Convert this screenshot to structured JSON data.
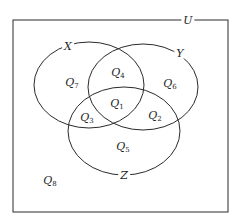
{
  "diagram": {
    "type": "venn",
    "universe": {
      "label": "U",
      "x": 13,
      "y": 20,
      "width": 215,
      "height": 192
    },
    "sets": [
      {
        "id": "X",
        "label": "X",
        "cx": 89,
        "cy": 85,
        "rx": 55,
        "ry": 43,
        "label_x": 68,
        "label_y": 46
      },
      {
        "id": "Y",
        "label": "Y",
        "cx": 143,
        "cy": 87,
        "rx": 55,
        "ry": 43,
        "label_x": 180,
        "label_y": 53
      },
      {
        "id": "Z",
        "label": "Z",
        "cx": 124,
        "cy": 131,
        "rx": 56,
        "ry": 44,
        "label_x": 124,
        "label_y": 175
      }
    ],
    "regions": [
      {
        "name": "Q",
        "sub": "1",
        "x": 117,
        "y": 104,
        "description": "X ∩ Y ∩ Z"
      },
      {
        "name": "Q",
        "sub": "2",
        "x": 155,
        "y": 116,
        "description": "Y ∩ Z only"
      },
      {
        "name": "Q",
        "sub": "3",
        "x": 87,
        "y": 118,
        "description": "X ∩ Z only"
      },
      {
        "name": "Q",
        "sub": "4",
        "x": 118,
        "y": 73,
        "description": "X ∩ Y only"
      },
      {
        "name": "Q",
        "sub": "5",
        "x": 123,
        "y": 147,
        "description": "Z only"
      },
      {
        "name": "Q",
        "sub": "6",
        "x": 170,
        "y": 84,
        "description": "Y only"
      },
      {
        "name": "Q",
        "sub": "7",
        "x": 72,
        "y": 83,
        "description": "X only"
      },
      {
        "name": "Q",
        "sub": "8",
        "x": 50,
        "y": 181,
        "description": "outside X, Y, Z"
      }
    ],
    "u_label_x": 188,
    "u_label_y": 20,
    "stroke_color": "#2a2a2a"
  }
}
